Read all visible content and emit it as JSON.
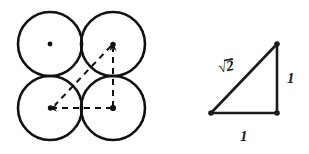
{
  "figure": {
    "background_color": "#ffffff",
    "ink_color": "#111111"
  },
  "packing_diagram": {
    "name": "four-circle-square-packing",
    "circle_radius": 32,
    "stroke_color": "#111111",
    "circles": [
      {
        "id": "top-left",
        "cx": 50,
        "cy": 44,
        "has_center_dot": true,
        "dot_style": "plain"
      },
      {
        "id": "top-right",
        "cx": 113,
        "cy": 44,
        "has_center_dot": true,
        "dot_style": "arrow-target"
      },
      {
        "id": "bottom-left",
        "cx": 50,
        "cy": 108,
        "has_center_dot": true,
        "dot_style": "arrow-target"
      },
      {
        "id": "bottom-right",
        "cx": 113,
        "cy": 108,
        "has_center_dot": true,
        "dot_style": "origin"
      }
    ],
    "dashed_triangle": {
      "stroke_dasharray": "6 5",
      "vertical_leg": {
        "from": [
          113,
          108
        ],
        "to": [
          113,
          44
        ],
        "arrow_at": "to"
      },
      "horizontal_leg": {
        "from": [
          113,
          108
        ],
        "to": [
          50,
          108
        ],
        "arrow_at": "to"
      },
      "hypotenuse": {
        "from": [
          113,
          44
        ],
        "to": [
          50,
          108
        ],
        "arrow_at": "none"
      }
    }
  },
  "triangle_diagram": {
    "name": "right-triangle-1-1-sqrt2",
    "stroke_color": "#1a1a1a",
    "vertices": {
      "top_right": [
        277,
        44
      ],
      "bottom_right": [
        277,
        113
      ],
      "bottom_left": [
        211,
        113
      ]
    },
    "labels": {
      "hypotenuse": {
        "text": "2",
        "prefix": "√",
        "display": "√2",
        "x": 228,
        "y": 70
      },
      "vertical_leg": {
        "text": "1",
        "x": 290,
        "y": 83
      },
      "horizontal_leg": {
        "text": "1",
        "x": 242,
        "y": 139
      }
    }
  }
}
